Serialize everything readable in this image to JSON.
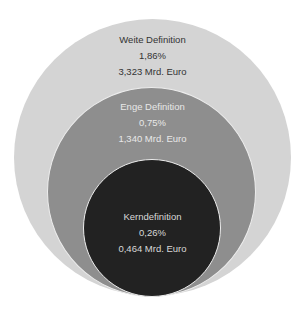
{
  "diagram": {
    "type": "nested-circles",
    "circles": [
      {
        "name": "Weite Definition",
        "percent": "1,86%",
        "value": "3,323 Mrd. Euro",
        "color": "#d4d4d4"
      },
      {
        "name": "Enge Definition",
        "percent": "0,75%",
        "value": "1,340 Mrd. Euro",
        "color": "#8e8e8e"
      },
      {
        "name": "Kerndefinition",
        "percent": "0,26%",
        "value": "0,464 Mrd. Euro",
        "color": "#222222"
      }
    ]
  }
}
